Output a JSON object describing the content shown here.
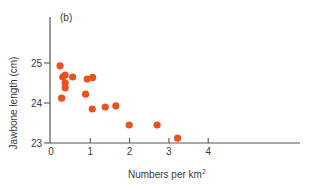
{
  "chart_data": {
    "type": "scatter",
    "panel_label": "(b)",
    "title": "",
    "xlabel": "Numbers per km",
    "xlabel_superscript": "2",
    "ylabel": "Jawbone length (cm)",
    "xlim": [
      0,
      4
    ],
    "ylim": [
      23,
      25
    ],
    "xticks": [
      "0",
      "1",
      "2",
      "3",
      "4"
    ],
    "yticks": [
      "23",
      "24",
      "25"
    ],
    "grid": false,
    "legend": null,
    "marker_color": "#e8521e",
    "axis_color": "#555555",
    "series": [
      {
        "name": "observations",
        "points": [
          {
            "x": 0.23,
            "y": 24.93
          },
          {
            "x": 0.3,
            "y": 24.65
          },
          {
            "x": 0.36,
            "y": 24.7
          },
          {
            "x": 0.55,
            "y": 24.65
          },
          {
            "x": 0.36,
            "y": 24.5
          },
          {
            "x": 0.36,
            "y": 24.38
          },
          {
            "x": 0.27,
            "y": 24.12
          },
          {
            "x": 0.92,
            "y": 24.6
          },
          {
            "x": 1.06,
            "y": 24.64
          },
          {
            "x": 0.88,
            "y": 24.22
          },
          {
            "x": 1.05,
            "y": 23.85
          },
          {
            "x": 1.38,
            "y": 23.9
          },
          {
            "x": 1.65,
            "y": 23.93
          },
          {
            "x": 1.99,
            "y": 23.45
          },
          {
            "x": 2.7,
            "y": 23.45
          },
          {
            "x": 3.22,
            "y": 23.12
          }
        ]
      }
    ]
  }
}
